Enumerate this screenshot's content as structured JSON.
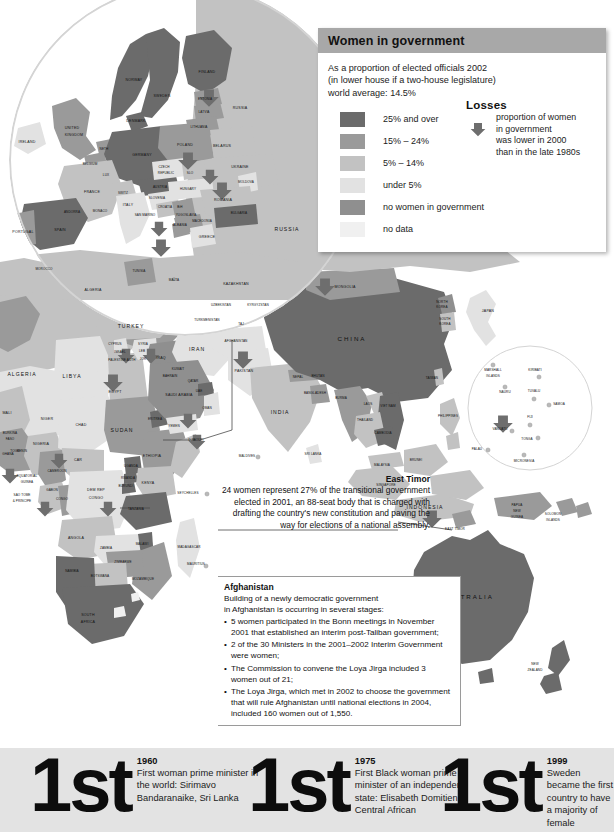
{
  "legend": {
    "title": "Women in government",
    "intro_line1": "As a proportion of elected officials 2002",
    "intro_line2": "(in lower house if a two-house legislature)",
    "intro_line3": "world average: 14.5%",
    "header_color": "#a8a8a8",
    "items": [
      {
        "label": "25% and over",
        "color": "#6b6b6b"
      },
      {
        "label": "15% – 24%",
        "color": "#9a9a9a"
      },
      {
        "label": "5% – 14%",
        "color": "#c2c2c2"
      },
      {
        "label": "under 5%",
        "color": "#e2e2e2"
      },
      {
        "label": "no women in government",
        "color": "#8f8f8f"
      },
      {
        "label": "no data",
        "color": "#f0f0f0"
      }
    ],
    "losses": {
      "title": "Losses",
      "line1": "proportion of women",
      "line2": "in government",
      "line3": "was lower in 2000",
      "line4": "than in the late 1980s",
      "arrow_icon": "down-arrow-icon",
      "arrow_color": "#6e6e6e"
    }
  },
  "callouts": {
    "east_timor": {
      "title": "East Timor",
      "body": "24 women represent 27% of the transitional government elected in 2001, an 88-seat body that is charged with drafting the country's new constitution and paving the way for elections of a national assembly."
    },
    "afghanistan": {
      "title": "Afghanistan",
      "body_line1": "Building of a newly democratic government",
      "body_line2": "in Afghanistan is occurring in several stages:",
      "bullets": [
        "5 women participated in the Bonn meetings in November 2001 that established an interim post-Taliban government;",
        "2 of the 30 Ministers in the 2001–2002 Interim Government were women;",
        "The Commission to convene the Loya Jirga included 3 women out of 21;",
        "The Loya Jirga, which met in 2002 to choose the government that will rule Afghanistan until national elections in 2004, included 160 women out of 1,550."
      ]
    }
  },
  "facts": [
    {
      "rank": "1st",
      "year": "1960",
      "description": "First woman prime minister in the world: Sirimavo Bandaranaike, Sri Lanka"
    },
    {
      "rank": "1st",
      "year": "1975",
      "description": "First Black woman prime minister of an independent state: Elisabeth Domitien, Central African"
    },
    {
      "rank": "1st",
      "year": "1999",
      "description": "Sweden became the first country to have a majority of female government ministers."
    }
  ],
  "chart_data": {
    "type": "map",
    "title": "Women in government",
    "subtitle": "As a proportion of elected officials 2002 (in lower house if a two-house legislature)",
    "world_average_percent": 14.5,
    "palette": {
      "over_25": "#6b6b6b",
      "pct_15_24": "#9a9a9a",
      "pct_5_14": "#c2c2c2",
      "under_5": "#e2e2e2",
      "none": "#8f8f8f",
      "no_data": "#f0f0f0",
      "ocean": "#ffffff",
      "losses_arrow": "#6e6e6e",
      "strip_bg": "#e3e3e3"
    },
    "map_labels": [
      {
        "name": "IRELAND",
        "x": 27,
        "y": 142,
        "size": "sm"
      },
      {
        "name": "UNITED",
        "x": 72,
        "y": 128,
        "size": "sm"
      },
      {
        "name": "KINGDOM",
        "x": 74,
        "y": 135,
        "size": "sm"
      },
      {
        "name": "NORWAY",
        "x": 134,
        "y": 80,
        "size": "sm"
      },
      {
        "name": "SWEDEN",
        "x": 162,
        "y": 96,
        "size": "sm"
      },
      {
        "name": "FINLAND",
        "x": 207,
        "y": 72,
        "size": "sm"
      },
      {
        "name": "DENMARK",
        "x": 136,
        "y": 121,
        "size": "sm"
      },
      {
        "name": "ESTONIA",
        "x": 205,
        "y": 100,
        "size": "tiny"
      },
      {
        "name": "LATVIA",
        "x": 204,
        "y": 113,
        "size": "tiny"
      },
      {
        "name": "LITHUANIA",
        "x": 199,
        "y": 128,
        "size": "tiny"
      },
      {
        "name": "RUSSIA",
        "x": 240,
        "y": 108,
        "size": "sm"
      },
      {
        "name": "BELARUS",
        "x": 222,
        "y": 146,
        "size": "sm"
      },
      {
        "name": "POLAND",
        "x": 185,
        "y": 145,
        "size": "sm"
      },
      {
        "name": "GERMANY",
        "x": 142,
        "y": 155,
        "size": "sm"
      },
      {
        "name": "NETH",
        "x": 104,
        "y": 150,
        "size": "tiny"
      },
      {
        "name": "BELGIUM",
        "x": 90,
        "y": 165,
        "size": "tiny"
      },
      {
        "name": "LUX",
        "x": 106,
        "y": 176,
        "size": "tiny"
      },
      {
        "name": "FRANCE",
        "x": 92,
        "y": 192,
        "size": "sm"
      },
      {
        "name": "SWITZ",
        "x": 123,
        "y": 194,
        "size": "tiny"
      },
      {
        "name": "AUSTRIA",
        "x": 160,
        "y": 188,
        "size": "tiny"
      },
      {
        "name": "CZECH",
        "x": 164,
        "y": 168,
        "size": "tiny"
      },
      {
        "name": "REPUBLIC",
        "x": 166,
        "y": 174,
        "size": "tiny"
      },
      {
        "name": "SLO",
        "x": 190,
        "y": 174,
        "size": "tiny"
      },
      {
        "name": "HUNGARY",
        "x": 188,
        "y": 190,
        "size": "tiny"
      },
      {
        "name": "UKRAINE",
        "x": 240,
        "y": 167,
        "size": "sm"
      },
      {
        "name": "MOLDOVA",
        "x": 246,
        "y": 183,
        "size": "tiny"
      },
      {
        "name": "ROMANIA",
        "x": 223,
        "y": 200,
        "size": "sm"
      },
      {
        "name": "BULGARIA",
        "x": 239,
        "y": 214,
        "size": "tiny"
      },
      {
        "name": "SLOVENIA",
        "x": 157,
        "y": 199,
        "size": "tiny"
      },
      {
        "name": "CROATIA",
        "x": 165,
        "y": 208,
        "size": "tiny"
      },
      {
        "name": "BiH",
        "x": 180,
        "y": 208,
        "size": "tiny"
      },
      {
        "name": "YUGOSLAVIA",
        "x": 186,
        "y": 216,
        "size": "tiny"
      },
      {
        "name": "MACEDONIA",
        "x": 202,
        "y": 222,
        "size": "tiny"
      },
      {
        "name": "ALBANIA",
        "x": 180,
        "y": 226,
        "size": "tiny"
      },
      {
        "name": "GREECE",
        "x": 207,
        "y": 237,
        "size": "sm"
      },
      {
        "name": "ITALY",
        "x": 128,
        "y": 205,
        "size": "sm"
      },
      {
        "name": "SAN MARINO",
        "x": 145,
        "y": 216,
        "size": "tiny"
      },
      {
        "name": "MONACO",
        "x": 100,
        "y": 212,
        "size": "tiny"
      },
      {
        "name": "ANDORRA",
        "x": 72,
        "y": 213,
        "size": "tiny"
      },
      {
        "name": "SPAIN",
        "x": 60,
        "y": 230,
        "size": "sm"
      },
      {
        "name": "PORTUGAL",
        "x": 23,
        "y": 232,
        "size": "sm"
      },
      {
        "name": "MOROCCO",
        "x": 44,
        "y": 270,
        "size": "tiny"
      },
      {
        "name": "TUNISIA",
        "x": 139,
        "y": 272,
        "size": "tiny"
      },
      {
        "name": "MALTA",
        "x": 174,
        "y": 281,
        "size": "tiny"
      },
      {
        "name": "ALGERIA",
        "x": 93,
        "y": 290,
        "size": "sm"
      },
      {
        "name": "ALGERIA",
        "x": 22,
        "y": 375,
        "size": "mid"
      },
      {
        "name": "LIBYA",
        "x": 72,
        "y": 377,
        "size": "mid"
      },
      {
        "name": "EGYPT",
        "x": 115,
        "y": 392,
        "size": "sm"
      },
      {
        "name": "TURKEY",
        "x": 131,
        "y": 327,
        "size": "mid"
      },
      {
        "name": "CYPRUS",
        "x": 115,
        "y": 345,
        "size": "tiny"
      },
      {
        "name": "ISRAEL",
        "x": 120,
        "y": 353,
        "size": "tiny"
      },
      {
        "name": "PALESTINE AUTH",
        "x": 122,
        "y": 361,
        "size": "tiny"
      },
      {
        "name": "LEB",
        "x": 142,
        "y": 352,
        "size": "tiny"
      },
      {
        "name": "SYRIA",
        "x": 143,
        "y": 345,
        "size": "tiny"
      },
      {
        "name": "JOR",
        "x": 143,
        "y": 360,
        "size": "tiny"
      },
      {
        "name": "IRAQ",
        "x": 161,
        "y": 358,
        "size": "sm"
      },
      {
        "name": "IRAN",
        "x": 197,
        "y": 350,
        "size": "mid"
      },
      {
        "name": "KUWAIT",
        "x": 178,
        "y": 370,
        "size": "tiny"
      },
      {
        "name": "BAHRAIN",
        "x": 170,
        "y": 377,
        "size": "tiny"
      },
      {
        "name": "QATAR",
        "x": 193,
        "y": 382,
        "size": "tiny"
      },
      {
        "name": "UAE",
        "x": 199,
        "y": 392,
        "size": "tiny"
      },
      {
        "name": "SAUDI ARABIA",
        "x": 179,
        "y": 395,
        "size": "sm"
      },
      {
        "name": "OMAN",
        "x": 207,
        "y": 409,
        "size": "tiny"
      },
      {
        "name": "YEMEN",
        "x": 174,
        "y": 427,
        "size": "tiny"
      },
      {
        "name": "ERITREA",
        "x": 155,
        "y": 420,
        "size": "tiny"
      },
      {
        "name": "DJIBOUTI",
        "x": 196,
        "y": 441,
        "size": "tiny"
      },
      {
        "name": "SUDAN",
        "x": 122,
        "y": 431,
        "size": "mid"
      },
      {
        "name": "CHAD",
        "x": 81,
        "y": 425,
        "size": "sm"
      },
      {
        "name": "NIGER",
        "x": 47,
        "y": 419,
        "size": "sm"
      },
      {
        "name": "MALI",
        "x": 7,
        "y": 413,
        "size": "sm"
      },
      {
        "name": "BURKINA",
        "x": 10,
        "y": 434,
        "size": "tiny"
      },
      {
        "name": "FASO",
        "x": 10,
        "y": 440,
        "size": "tiny"
      },
      {
        "name": "NIGERIA",
        "x": 41,
        "y": 444,
        "size": "sm"
      },
      {
        "name": "BENIN",
        "x": 22,
        "y": 452,
        "size": "tiny"
      },
      {
        "name": "TOGO",
        "x": 15,
        "y": 452,
        "size": "tiny"
      },
      {
        "name": "GHANA",
        "x": 8,
        "y": 455,
        "size": "tiny"
      },
      {
        "name": "CAR",
        "x": 78,
        "y": 460,
        "size": "sm"
      },
      {
        "name": "CAMEROON",
        "x": 57,
        "y": 472,
        "size": "tiny"
      },
      {
        "name": "EQUATORIAL",
        "x": 27,
        "y": 477,
        "size": "tiny"
      },
      {
        "name": "GUINEA",
        "x": 27,
        "y": 483,
        "size": "tiny"
      },
      {
        "name": "GABON",
        "x": 52,
        "y": 491,
        "size": "tiny"
      },
      {
        "name": "CONGO",
        "x": 62,
        "y": 500,
        "size": "tiny"
      },
      {
        "name": "SAO TOME",
        "x": 22,
        "y": 496,
        "size": "tiny"
      },
      {
        "name": "& PRINCIPE",
        "x": 22,
        "y": 502,
        "size": "tiny"
      },
      {
        "name": "DEM REP",
        "x": 96,
        "y": 490,
        "size": "sm"
      },
      {
        "name": "CONGO",
        "x": 96,
        "y": 498,
        "size": "sm"
      },
      {
        "name": "ETHIOPIA",
        "x": 152,
        "y": 456,
        "size": "sm"
      },
      {
        "name": "KENYA",
        "x": 148,
        "y": 483,
        "size": "sm"
      },
      {
        "name": "UGANDA",
        "x": 131,
        "y": 467,
        "size": "tiny"
      },
      {
        "name": "RWANDA",
        "x": 128,
        "y": 479,
        "size": "tiny"
      },
      {
        "name": "BURUNDI",
        "x": 126,
        "y": 487,
        "size": "tiny"
      },
      {
        "name": "TANZANIA",
        "x": 136,
        "y": 510,
        "size": "tiny"
      },
      {
        "name": "SEYCHELLES",
        "x": 188,
        "y": 494,
        "size": "tiny"
      },
      {
        "name": "ANGOLA",
        "x": 76,
        "y": 538,
        "size": "sm"
      },
      {
        "name": "ZAMBIA",
        "x": 106,
        "y": 549,
        "size": "tiny"
      },
      {
        "name": "MALAWI",
        "x": 142,
        "y": 545,
        "size": "tiny"
      },
      {
        "name": "ZIMBABWE",
        "x": 123,
        "y": 563,
        "size": "tiny"
      },
      {
        "name": "BOTSWANA",
        "x": 100,
        "y": 577,
        "size": "tiny"
      },
      {
        "name": "NAMIBIA",
        "x": 72,
        "y": 572,
        "size": "tiny"
      },
      {
        "name": "MOZAMBIQUE",
        "x": 143,
        "y": 580,
        "size": "tiny"
      },
      {
        "name": "SOUTH",
        "x": 88,
        "y": 615,
        "size": "sm"
      },
      {
        "name": "AFRICA",
        "x": 88,
        "y": 622,
        "size": "sm"
      },
      {
        "name": "MADAGASCAR",
        "x": 189,
        "y": 548,
        "size": "tiny"
      },
      {
        "name": "MAURITIUS",
        "x": 196,
        "y": 565,
        "size": "tiny"
      },
      {
        "name": "KAZAKHSTAN",
        "x": 236,
        "y": 284,
        "size": "sm"
      },
      {
        "name": "UZBEKISTAN",
        "x": 221,
        "y": 306,
        "size": "tiny"
      },
      {
        "name": "TURKMENISTAN",
        "x": 207,
        "y": 321,
        "size": "tiny"
      },
      {
        "name": "KYRGYZSTAN",
        "x": 258,
        "y": 306,
        "size": "tiny"
      },
      {
        "name": "TAJ",
        "x": 241,
        "y": 325,
        "size": "tiny"
      },
      {
        "name": "AFGHANISTAN",
        "x": 236,
        "y": 342,
        "size": "tiny"
      },
      {
        "name": "PAKISTAN",
        "x": 244,
        "y": 371,
        "size": "sm"
      },
      {
        "name": "MONGOLIA",
        "x": 345,
        "y": 287,
        "size": "sm"
      },
      {
        "name": "CHINA",
        "x": 352,
        "y": 339,
        "size": "big"
      },
      {
        "name": "INDIA",
        "x": 280,
        "y": 413,
        "size": "mid"
      },
      {
        "name": "NEPAL",
        "x": 298,
        "y": 378,
        "size": "tiny"
      },
      {
        "name": "BHUTAN",
        "x": 318,
        "y": 377,
        "size": "tiny"
      },
      {
        "name": "BANGLADESH",
        "x": 315,
        "y": 394,
        "size": "tiny"
      },
      {
        "name": "BURMA",
        "x": 341,
        "y": 399,
        "size": "tiny"
      },
      {
        "name": "LAOS",
        "x": 368,
        "y": 405,
        "size": "tiny"
      },
      {
        "name": "VIET NAM",
        "x": 388,
        "y": 407,
        "size": "tiny"
      },
      {
        "name": "THAILAND",
        "x": 365,
        "y": 421,
        "size": "tiny"
      },
      {
        "name": "CAMBODIA",
        "x": 383,
        "y": 434,
        "size": "tiny"
      },
      {
        "name": "SRI LANKA",
        "x": 313,
        "y": 455,
        "size": "tiny"
      },
      {
        "name": "MALDIVES",
        "x": 247,
        "y": 457,
        "size": "tiny"
      },
      {
        "name": "JAPAN",
        "x": 488,
        "y": 311,
        "size": "sm"
      },
      {
        "name": "NORTH",
        "x": 442,
        "y": 303,
        "size": "tiny"
      },
      {
        "name": "KOREA",
        "x": 442,
        "y": 308,
        "size": "tiny"
      },
      {
        "name": "SOUTH",
        "x": 445,
        "y": 320,
        "size": "tiny"
      },
      {
        "name": "KOREA",
        "x": 445,
        "y": 325,
        "size": "tiny"
      },
      {
        "name": "TAIWAN",
        "x": 432,
        "y": 379,
        "size": "tiny"
      },
      {
        "name": "PHILIPPINES",
        "x": 448,
        "y": 417,
        "size": "tiny"
      },
      {
        "name": "MALAYSIA",
        "x": 382,
        "y": 466,
        "size": "tiny"
      },
      {
        "name": "SINGAPORE",
        "x": 386,
        "y": 486,
        "size": "tiny"
      },
      {
        "name": "BRUNEI",
        "x": 416,
        "y": 461,
        "size": "tiny"
      },
      {
        "name": "INDONESIA",
        "x": 425,
        "y": 508,
        "size": "mid"
      },
      {
        "name": "EAST TIMOR",
        "x": 455,
        "y": 530,
        "size": "tiny"
      },
      {
        "name": "PAPUA",
        "x": 517,
        "y": 506,
        "size": "tiny"
      },
      {
        "name": "NEW",
        "x": 517,
        "y": 512,
        "size": "tiny"
      },
      {
        "name": "GUINEA",
        "x": 517,
        "y": 518,
        "size": "tiny"
      },
      {
        "name": "SOLOMON",
        "x": 553,
        "y": 515,
        "size": "tiny"
      },
      {
        "name": "ISLANDS",
        "x": 553,
        "y": 521,
        "size": "tiny"
      },
      {
        "name": "AUSTRALIA",
        "x": 468,
        "y": 597,
        "size": "big"
      },
      {
        "name": "NEW",
        "x": 535,
        "y": 665,
        "size": "tiny"
      },
      {
        "name": "ZEALAND",
        "x": 535,
        "y": 671,
        "size": "tiny"
      },
      {
        "name": "MARSHALL",
        "x": 493,
        "y": 371,
        "size": "tiny"
      },
      {
        "name": "ISLANDS",
        "x": 493,
        "y": 377,
        "size": "tiny"
      },
      {
        "name": "KIRIBATI",
        "x": 535,
        "y": 371,
        "size": "tiny"
      },
      {
        "name": "NAURU",
        "x": 505,
        "y": 393,
        "size": "tiny"
      },
      {
        "name": "TUVALU",
        "x": 534,
        "y": 392,
        "size": "tiny"
      },
      {
        "name": "SAMOA",
        "x": 559,
        "y": 405,
        "size": "tiny"
      },
      {
        "name": "FIJI",
        "x": 530,
        "y": 418,
        "size": "tiny"
      },
      {
        "name": "VANUATU",
        "x": 500,
        "y": 430,
        "size": "tiny"
      },
      {
        "name": "TONGA",
        "x": 527,
        "y": 440,
        "size": "tiny"
      },
      {
        "name": "PALAU",
        "x": 477,
        "y": 450,
        "size": "tiny"
      },
      {
        "name": "MICRONESIA",
        "x": 524,
        "y": 462,
        "size": "tiny"
      },
      {
        "name": "RUSSIA",
        "x": 287,
        "y": 230,
        "size": "mid"
      }
    ]
  }
}
